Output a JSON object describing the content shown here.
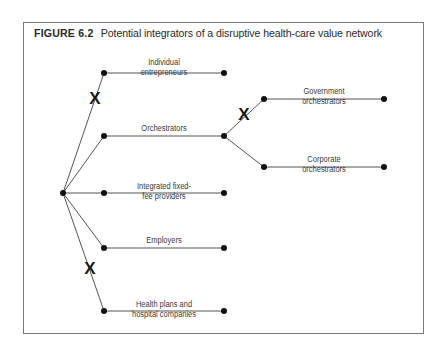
{
  "figure": {
    "number": "FIGURE 6.2",
    "title": "Potential integrators of a disruptive health-care value network"
  },
  "diagram": {
    "root": {
      "x": 63,
      "y": 193
    },
    "branches": [
      {
        "id": "individual",
        "label_lines": [
          "Individual",
          "entrepreneurs"
        ],
        "x1": 104,
        "y": 73,
        "x2": 224,
        "blocked": true
      },
      {
        "id": "orchestrators",
        "label_lines": [
          "Orchestrators"
        ],
        "x1": 104,
        "y": 136,
        "x2": 224,
        "blocked": false
      },
      {
        "id": "integrated",
        "label_lines": [
          "Integrated fixed-",
          "fee providers"
        ],
        "x1": 104,
        "y": 193,
        "x2": 224,
        "blocked": false
      },
      {
        "id": "employers",
        "label_lines": [
          "Employers"
        ],
        "x1": 104,
        "y": 248,
        "x2": 224,
        "blocked": false
      },
      {
        "id": "health-plans",
        "label_lines": [
          "Health plans and",
          "hospital companies"
        ],
        "x1": 104,
        "y": 311,
        "x2": 224,
        "blocked": true
      }
    ],
    "sub_branches": {
      "parent": "orchestrators",
      "items": [
        {
          "id": "government",
          "label_lines": [
            "Government",
            "orchestrators"
          ],
          "x1": 264,
          "y": 99,
          "x2": 384,
          "blocked": true
        },
        {
          "id": "corporate",
          "label_lines": [
            "Corporate",
            "orchestrators"
          ],
          "x1": 264,
          "y": 167,
          "x2": 384,
          "blocked": false
        }
      ]
    },
    "blocked_marker": "X",
    "labels": {
      "individual": [
        "Individual",
        "entrepreneurs"
      ],
      "orchestrators": [
        "Orchestrators"
      ],
      "integrated": [
        "Integrated fixed-",
        "fee providers"
      ],
      "employers": [
        "Employers"
      ],
      "health_plans": [
        "Health plans and",
        "hospital companies"
      ],
      "government": [
        "Government",
        "orchestrators"
      ],
      "corporate": [
        "Corporate",
        "orchestrators"
      ]
    },
    "colors": {
      "line": "#555555",
      "node": "#111111",
      "frame": "#7a7a7a",
      "text": "#3a3a3a"
    }
  }
}
